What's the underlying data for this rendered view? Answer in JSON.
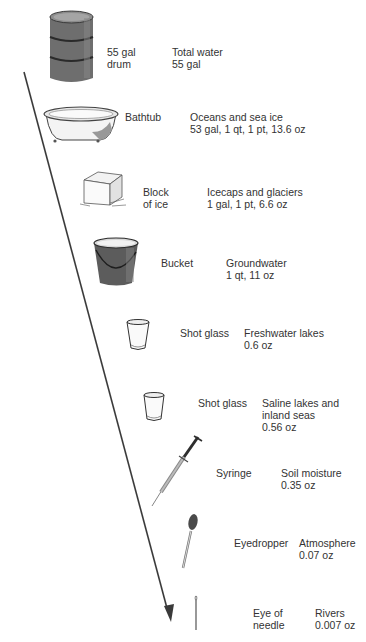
{
  "diagram": {
    "arrow": {
      "from": [
        24,
        72
      ],
      "to": [
        170,
        622
      ],
      "color": "#3a3a3a"
    },
    "rows": [
      {
        "container": "55 gal\ndrum",
        "reservoir": "Total water",
        "amount": "55 gal",
        "icon": "drum-icon"
      },
      {
        "container": "Bathtub",
        "reservoir": "Oceans and sea ice",
        "amount": "53 gal, 1 qt, 1 pt, 13.6 oz",
        "icon": "bathtub-icon"
      },
      {
        "container": "Block\nof ice",
        "reservoir": "Icecaps and glaciers",
        "amount": "1 gal, 1 pt, 6.6 oz",
        "icon": "ice-block-icon"
      },
      {
        "container": "Bucket",
        "reservoir": "Groundwater",
        "amount": "1 qt, 11 oz",
        "icon": "bucket-icon"
      },
      {
        "container": "Shot glass",
        "reservoir": "Freshwater lakes",
        "amount": "0.6 oz",
        "icon": "shot-glass-icon"
      },
      {
        "container": "Shot glass",
        "reservoir": "Saline lakes and\ninland seas",
        "amount": "0.56 oz",
        "icon": "shot-glass-icon"
      },
      {
        "container": "Syringe",
        "reservoir": "Soil moisture",
        "amount": "0.35 oz",
        "icon": "syringe-icon"
      },
      {
        "container": "Eyedropper",
        "reservoir": "Atmosphere",
        "amount": "0.07 oz",
        "icon": "eyedropper-icon"
      },
      {
        "container": "Eye of\nneedle",
        "reservoir": "Rivers",
        "amount": "0.007 oz",
        "icon": "needle-icon"
      }
    ]
  },
  "labels": {
    "r0c1": "55 gal",
    "r0c2": "drum",
    "r0r": "Total water",
    "r0a": "55 gal",
    "r1c": "Bathtub",
    "r1r": "Oceans and sea ice",
    "r1a": "53 gal, 1 qt, 1 pt, 13.6 oz",
    "r2c1": "Block",
    "r2c2": "of ice",
    "r2r": "Icecaps and glaciers",
    "r2a": "1 gal, 1 pt, 6.6 oz",
    "r3c": "Bucket",
    "r3r": "Groundwater",
    "r3a": "1 qt, 11 oz",
    "r4c": "Shot glass",
    "r4r": "Freshwater lakes",
    "r4a": "0.6 oz",
    "r5c": "Shot glass",
    "r5r1": "Saline lakes and",
    "r5r2": "inland seas",
    "r5a": "0.56 oz",
    "r6c": "Syringe",
    "r6r": "Soil moisture",
    "r6a": "0.35 oz",
    "r7c": "Eyedropper",
    "r7r": "Atmosphere",
    "r7a": "0.07 oz",
    "r8c1": "Eye of",
    "r8c2": "needle",
    "r8r": "Rivers",
    "r8a": "0.007 oz"
  }
}
